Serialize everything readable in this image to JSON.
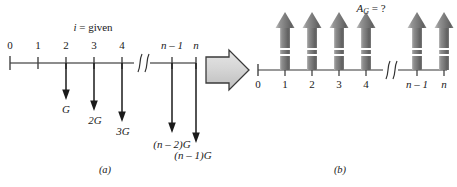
{
  "figure": {
    "panel_a": {
      "caption": "(a)",
      "header_label": "i = given",
      "axis_ticks": [
        "0",
        "1",
        "2",
        "3",
        "4",
        "n – 1",
        "n"
      ],
      "break_symbol": "∫∫",
      "cash_flows": [
        {
          "at_tick": "2",
          "label": "G",
          "direction": "down"
        },
        {
          "at_tick": "3",
          "label": "2G",
          "direction": "down"
        },
        {
          "at_tick": "4",
          "label": "3G",
          "direction": "down"
        },
        {
          "at_tick": "n – 1",
          "label": "(n – 2)G",
          "direction": "down"
        },
        {
          "at_tick": "n",
          "label": "(n – 1)G",
          "direction": "down"
        }
      ]
    },
    "transition": {
      "icon": "block-right-arrow-icon"
    },
    "panel_b": {
      "caption": "(b)",
      "header_label": "A_G = ?",
      "header_label_base": "A",
      "header_label_sub": "G",
      "header_label_tail": " = ?",
      "axis_ticks": [
        "0",
        "1",
        "2",
        "3",
        "4",
        "n – 1",
        "n"
      ],
      "break_symbol": "∫∫",
      "cash_flows": [
        {
          "at_tick": "1",
          "direction": "up"
        },
        {
          "at_tick": "2",
          "direction": "up"
        },
        {
          "at_tick": "3",
          "direction": "up"
        },
        {
          "at_tick": "4",
          "direction": "up"
        },
        {
          "at_tick": "n – 1",
          "direction": "up"
        },
        {
          "at_tick": "n",
          "direction": "up"
        }
      ]
    },
    "colors": {
      "ink": "#1a1a1a",
      "axis": "#555555",
      "arrow_fill_light": "#d8d8d8",
      "arrow_fill_dark": "#6f6f6f",
      "block_arrow_fill": "#d4d4d4",
      "block_arrow_stroke": "#3a3a3a",
      "background": "#ffffff"
    }
  }
}
